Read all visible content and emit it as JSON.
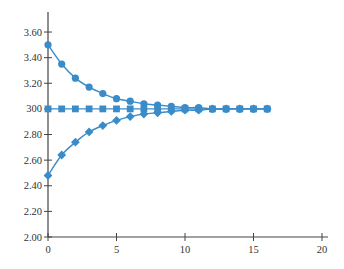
{
  "chart_data": {
    "type": "line",
    "title": "",
    "xlabel": "",
    "ylabel": "",
    "xlim": [
      0,
      20
    ],
    "ylim": [
      2.0,
      3.7
    ],
    "grid": false,
    "legend": null,
    "x_ticks": [
      0,
      5,
      10,
      15,
      20
    ],
    "x_tick_labels": [
      "0",
      "5",
      "10",
      "15",
      "20"
    ],
    "y_ticks": [
      2.0,
      2.2,
      2.4,
      2.6,
      2.8,
      3.0,
      3.2,
      3.4,
      3.6
    ],
    "y_tick_labels": [
      "2.00",
      "2.20",
      "2.40",
      "2.60",
      "2.80",
      "300",
      "3.20",
      "3.40",
      "3.60"
    ],
    "x": [
      0,
      1,
      2,
      3,
      4,
      5,
      6,
      7,
      8,
      9,
      10,
      11,
      12,
      13,
      14,
      15,
      16
    ],
    "series": [
      {
        "name": "upper (circles)",
        "marker": "circle",
        "values": [
          3.5,
          3.35,
          3.24,
          3.17,
          3.12,
          3.08,
          3.06,
          3.04,
          3.03,
          3.02,
          3.01,
          3.01,
          3.0,
          3.0,
          3.0,
          3.0,
          3.0
        ]
      },
      {
        "name": "constant (squares)",
        "marker": "square",
        "values": [
          3.0,
          3.0,
          3.0,
          3.0,
          3.0,
          3.0,
          3.0,
          3.0,
          3.0,
          3.0,
          3.0,
          3.0,
          3.0,
          3.0,
          3.0,
          3.0,
          3.0
        ]
      },
      {
        "name": "lower (diamonds)",
        "marker": "diamond",
        "values": [
          2.48,
          2.64,
          2.74,
          2.82,
          2.87,
          2.91,
          2.94,
          2.96,
          2.97,
          2.98,
          2.99,
          2.99,
          3.0,
          3.0,
          3.0,
          3.0,
          3.0
        ]
      }
    ],
    "colors": {
      "series": "#3a8cc8",
      "axis": "#444444",
      "text": "#333333"
    }
  }
}
